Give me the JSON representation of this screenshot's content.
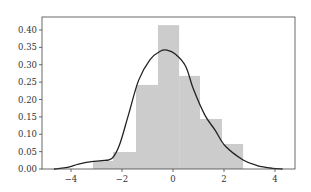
{
  "chart_data": {
    "type": "bar",
    "subtype": "histogram_with_kde",
    "title": "",
    "xlabel": "",
    "ylabel": "",
    "xlim": [
      -4.9,
      4.8
    ],
    "ylim": [
      0.0,
      0.437
    ],
    "grid": false,
    "legend": null,
    "xticks": [
      -4,
      -2,
      0,
      2,
      4
    ],
    "xtick_labels": [
      "−4",
      "−2",
      "0",
      "2",
      "4"
    ],
    "yticks": [
      0.0,
      0.05,
      0.1,
      0.15,
      0.2,
      0.25,
      0.3,
      0.35,
      0.4
    ],
    "ytick_labels": [
      "0.00",
      "0.05",
      "0.10",
      "0.15",
      "0.20",
      "0.25",
      "0.30",
      "0.35",
      "0.40"
    ],
    "histogram": {
      "bin_edges": [
        -3.14,
        -2.35,
        -1.45,
        -0.59,
        0.24,
        1.06,
        1.92,
        2.75
      ],
      "density": [
        0.023,
        0.049,
        0.242,
        0.414,
        0.268,
        0.144,
        0.072
      ],
      "color": "#cccccc"
    },
    "kde": {
      "color": "#222222",
      "x": [
        -4.67,
        -4.2,
        -3.7,
        -3.2,
        -2.8,
        -2.4,
        -2.1,
        -1.75,
        -1.35,
        -0.9,
        -0.5,
        -0.24,
        0.1,
        0.5,
        0.8,
        1.25,
        1.65,
        2.05,
        2.75,
        3.3,
        3.9,
        4.3
      ],
      "y": [
        0.0,
        0.004,
        0.014,
        0.021,
        0.024,
        0.03,
        0.069,
        0.155,
        0.255,
        0.315,
        0.339,
        0.342,
        0.33,
        0.295,
        0.23,
        0.155,
        0.112,
        0.066,
        0.026,
        0.01,
        0.002,
        0.0
      ]
    }
  }
}
